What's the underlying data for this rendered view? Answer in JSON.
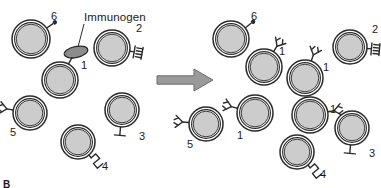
{
  "figure": {
    "panel_letter": "B",
    "immunogen_label": "Immunogen",
    "arrow_icon": "right-arrow-icon",
    "colors": {
      "cell_outline": "#2b2b2b",
      "cell_fill": "#cccccc",
      "cell_ring_fill": "#ffffff",
      "immunogen_fill": "#8c8c8c",
      "arrow_fill": "#9a9a9a",
      "text": "#1a1a1a"
    },
    "receptor_types": [
      {
        "id": "1",
        "shape": "y-shaped-antibody"
      },
      {
        "id": "2",
        "shape": "ladder-receptor"
      },
      {
        "id": "3",
        "shape": "t-shaped-receptor"
      },
      {
        "id": "4",
        "shape": "zigzag-receptor"
      },
      {
        "id": "5",
        "shape": "y-shaped-antibody"
      },
      {
        "id": "6",
        "shape": "dot-receptor"
      }
    ]
  },
  "left_panel": {
    "name": "pre-selection-lymphocyte-pool",
    "cells": [
      {
        "label": "6",
        "receptor": "dot-receptor",
        "cx": 31,
        "cy": 39,
        "r": 19,
        "rot": -35,
        "label_x": 51,
        "label_y": 11
      },
      {
        "label": "1",
        "receptor": "y-shaped-antibody",
        "cx": 60,
        "cy": 80,
        "r": 18,
        "rot": -62,
        "label_x": 81,
        "label_y": 60,
        "bound": true
      },
      {
        "label": "2",
        "receptor": "ladder-receptor",
        "cx": 112,
        "cy": 48,
        "r": 18,
        "rot": 10,
        "label_x": 136,
        "label_y": 23
      },
      {
        "label": "5",
        "receptor": "y-shaped-antibody",
        "cx": 30,
        "cy": 113,
        "r": 17,
        "rot": 190,
        "label_x": 10,
        "label_y": 127
      },
      {
        "label": "3",
        "receptor": "t-shaped-receptor",
        "cx": 122,
        "cy": 110,
        "r": 17,
        "rot": 95,
        "label_x": 139,
        "label_y": 131
      },
      {
        "label": "4",
        "receptor": "zigzag-receptor",
        "cx": 78,
        "cy": 142,
        "r": 17,
        "rot": 50,
        "label_x": 102,
        "label_y": 161
      }
    ],
    "immunogen": {
      "cx": 76,
      "cy": 52,
      "rx": 12,
      "ry": 5.5,
      "rot": -12
    }
  },
  "right_panel": {
    "name": "post-selection-expanded-clone",
    "cells": [
      {
        "label": "6",
        "receptor": "dot-receptor",
        "cx": 231,
        "cy": 39,
        "r": 18,
        "rot": -38,
        "label_x": 251,
        "label_y": 11
      },
      {
        "label": "1",
        "receptor": "y-shaped-antibody",
        "cx": 264,
        "cy": 67,
        "r": 18,
        "rot": -58,
        "label_x": 279,
        "label_y": 46
      },
      {
        "label": "1",
        "receptor": "y-shaped-antibody",
        "cx": 305,
        "cy": 78,
        "r": 18,
        "rot": -70,
        "label_x": 323,
        "label_y": 62
      },
      {
        "label": "2",
        "receptor": "ladder-receptor",
        "cx": 350,
        "cy": 47,
        "r": 17,
        "rot": 5,
        "label_x": 372,
        "label_y": 24
      },
      {
        "label": "1",
        "receptor": "y-shaped-antibody",
        "cx": 255,
        "cy": 113,
        "r": 18,
        "rot": 195,
        "label_x": 237,
        "label_y": 130
      },
      {
        "label": "1",
        "receptor": "y-shaped-antibody",
        "cx": 310,
        "cy": 115,
        "r": 18,
        "rot": -10,
        "label_x": 330,
        "label_y": 104
      },
      {
        "label": "5",
        "receptor": "y-shaped-antibody",
        "cx": 206,
        "cy": 124,
        "r": 17,
        "rot": 185,
        "label_x": 187,
        "label_y": 139
      },
      {
        "label": "3",
        "receptor": "t-shaped-receptor",
        "cx": 352,
        "cy": 128,
        "r": 17,
        "rot": 95,
        "label_x": 369,
        "label_y": 148
      },
      {
        "label": "4",
        "receptor": "zigzag-receptor",
        "cx": 297,
        "cy": 152,
        "r": 17,
        "rot": 50,
        "label_x": 320,
        "label_y": 169
      }
    ]
  },
  "arrow": {
    "x": 157,
    "y": 69,
    "w": 56,
    "h": 22
  }
}
